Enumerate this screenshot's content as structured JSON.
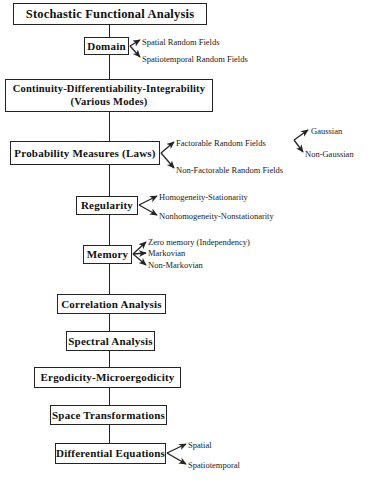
{
  "diagram": {
    "title": "Stochastic Functional Analysis",
    "type": "flowchart",
    "orientation": "vertical-spine-with-right-branches",
    "colors": {
      "background": "#ffffff",
      "stroke": "#242424",
      "text": "#1a1a1a"
    },
    "nodes": [
      {
        "id": "stochastic-functional-analysis",
        "label": "Stochastic  Functional  Analysis",
        "line2": "",
        "x": 13,
        "y": 3,
        "w": 194,
        "h": 22,
        "font_size": 12.5,
        "branches": []
      },
      {
        "id": "domain",
        "label": "Domain",
        "line2": "",
        "x": 84,
        "y": 37,
        "w": 45,
        "h": 18,
        "font_size": 11,
        "branches": [
          {
            "label": "Spatial Random Fields",
            "x": 142,
            "y": 38,
            "font_size": 8.5
          },
          {
            "label": "Spatiotemporal Random Fields",
            "x": 142,
            "y": 55,
            "font_size": 8.5
          }
        ]
      },
      {
        "id": "continuity-differentiability-integrability",
        "label": "Continuity-Differentiability-Integrability",
        "line2": "(Various Modes)",
        "x": 5,
        "y": 79,
        "w": 208,
        "h": 33,
        "font_size": 10.5,
        "branches": []
      },
      {
        "id": "probability-measures-laws",
        "label": "Probability  Measures  (Laws)",
        "line2": "",
        "x": 10,
        "y": 141,
        "w": 150,
        "h": 24,
        "font_size": 11,
        "branches": [
          {
            "label": "Factorable Random Fields",
            "x": 176,
            "y": 139,
            "font_size": 8.5
          },
          {
            "label": "Non-Factorable Random Fields",
            "x": 176,
            "y": 166,
            "font_size": 8.5
          }
        ]
      },
      {
        "id": "regularity",
        "label": "Regularity",
        "line2": "",
        "x": 76,
        "y": 196,
        "w": 62,
        "h": 19,
        "font_size": 11,
        "branches": [
          {
            "label": "Homogeneity-Stationarity",
            "x": 159,
            "y": 193,
            "font_size": 8.5
          },
          {
            "label": "Nonhomogeneity-Nonstationarity",
            "x": 159,
            "y": 212,
            "font_size": 8.5
          }
        ]
      },
      {
        "id": "memory",
        "label": "Memory",
        "line2": "",
        "x": 83,
        "y": 245,
        "w": 49,
        "h": 19,
        "font_size": 11,
        "branches": [
          {
            "label": "Zero memory (Independency)",
            "x": 148,
            "y": 239,
            "font_size": 8.5
          },
          {
            "label": "Markovian",
            "x": 148,
            "y": 250,
            "font_size": 8.5
          },
          {
            "label": "Non-Markovian",
            "x": 148,
            "y": 262,
            "font_size": 8.5
          }
        ]
      },
      {
        "id": "correlation-analysis",
        "label": "Correlation  Analysis",
        "line2": "",
        "x": 57,
        "y": 294,
        "w": 109,
        "h": 20,
        "font_size": 11,
        "branches": []
      },
      {
        "id": "spectral-analysis",
        "label": "Spectral  Analysis",
        "line2": "",
        "x": 66,
        "y": 331,
        "w": 89,
        "h": 20,
        "font_size": 11,
        "branches": []
      },
      {
        "id": "ergodicity-microergodicity",
        "label": "Ergodicity-Microergodicity",
        "line2": "",
        "x": 34,
        "y": 367,
        "w": 147,
        "h": 21,
        "font_size": 11,
        "branches": []
      },
      {
        "id": "space-transformations",
        "label": "Space  Transformations",
        "line2": "",
        "x": 50,
        "y": 405,
        "w": 117,
        "h": 20,
        "font_size": 11,
        "branches": []
      },
      {
        "id": "differential-equations",
        "label": "Differential  Equations",
        "line2": "",
        "x": 55,
        "y": 443,
        "w": 111,
        "h": 21,
        "font_size": 11,
        "branches": [
          {
            "label": "Spatial",
            "x": 188,
            "y": 441,
            "font_size": 8.5
          },
          {
            "label": "Spatiotemporal",
            "x": 188,
            "y": 461,
            "font_size": 8.5
          }
        ]
      }
    ],
    "sub_branches": [
      {
        "parent": "factorable-random-fields",
        "items": [
          {
            "label": "Gaussian",
            "x": 311,
            "y": 127,
            "font_size": 8.5
          },
          {
            "label": "Non-Gaussian",
            "x": 305,
            "y": 150,
            "font_size": 8.5
          }
        ]
      }
    ],
    "spine": {
      "x": 109,
      "top": 25,
      "bottom": 443
    }
  }
}
